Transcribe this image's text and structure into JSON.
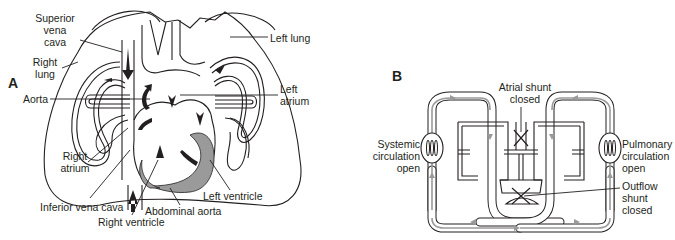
{
  "figure": {
    "panels": [
      {
        "id": "A",
        "letter": "A",
        "description": "Fetal heart and lungs with arrows showing blood flow",
        "labels": {
          "superior_vena_cava": [
            "Superior",
            "vena",
            "cava"
          ],
          "right_lung": [
            "Right",
            "lung"
          ],
          "aorta": "Aorta",
          "right_atrium": [
            "Right",
            "atrium"
          ],
          "inferior_vena_cava": "Inferior vena cava",
          "right_ventricle": "Right ventricle",
          "abdominal_aorta": "Abdominal aorta",
          "left_ventricle": "Left ventricle",
          "left_atrium": [
            "Left",
            "atrium"
          ],
          "left_lung": "Left lung"
        }
      },
      {
        "id": "B",
        "letter": "B",
        "description": "Schematic of circulation with shunts closed",
        "labels": {
          "atrial_shunt": [
            "Atrial shunt",
            "closed"
          ],
          "systemic": [
            "Systemic",
            "circulation",
            "open"
          ],
          "pulmonary": [
            "Pulmonary",
            "circulation",
            "open"
          ],
          "outflow_shunt": [
            "Outflow",
            "shunt",
            "closed"
          ]
        },
        "colors": {
          "flow_arrows": "#9a9a9a",
          "outline": "#231f20"
        }
      }
    ]
  }
}
